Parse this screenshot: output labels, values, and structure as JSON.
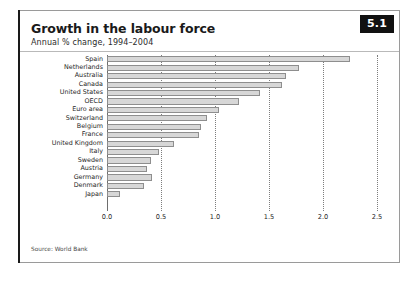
{
  "badge": {
    "number": "5.1"
  },
  "header": {
    "title": "Growth in the labour force",
    "subtitle": "Annual % change, 1994–2004"
  },
  "footer": {
    "source": "Source: World Bank"
  },
  "colors": {
    "bar_fill": "#d7d7d7",
    "bar_stroke": "#8e8e8e",
    "badge_bg": "#111111",
    "badge_text": "#ffffff",
    "frame": "#9a9a9a",
    "gridline": "#7d7d7d",
    "text": "#1f1f1f"
  },
  "chart_data": {
    "type": "bar",
    "orientation": "horizontal",
    "title": "Growth in the labour force",
    "subtitle": "Annual % change, 1994–2004",
    "xlabel": "",
    "ylabel": "",
    "xlim": [
      0.0,
      2.5
    ],
    "xticks": [
      "0.0",
      "0.5",
      "1.0",
      "1.5",
      "2.0",
      "2.5"
    ],
    "xtick_values": [
      0.0,
      0.5,
      1.0,
      1.5,
      2.0,
      2.5
    ],
    "grid": true,
    "grid_axis": "x",
    "grid_style": "dotted",
    "legend": "none",
    "source": "Source: World Bank",
    "categories": [
      "Spain",
      "Netherlands",
      "Australia",
      "Canada",
      "United States",
      "OECD",
      "Euro area",
      "Switzerland",
      "Belgium",
      "France",
      "United Kingdom",
      "Italy",
      "Sweden",
      "Austria",
      "Germany",
      "Denmark",
      "Japan"
    ],
    "values": [
      2.25,
      1.78,
      1.66,
      1.62,
      1.42,
      1.22,
      1.04,
      0.93,
      0.87,
      0.85,
      0.62,
      0.48,
      0.41,
      0.37,
      0.42,
      0.34,
      0.12
    ]
  }
}
